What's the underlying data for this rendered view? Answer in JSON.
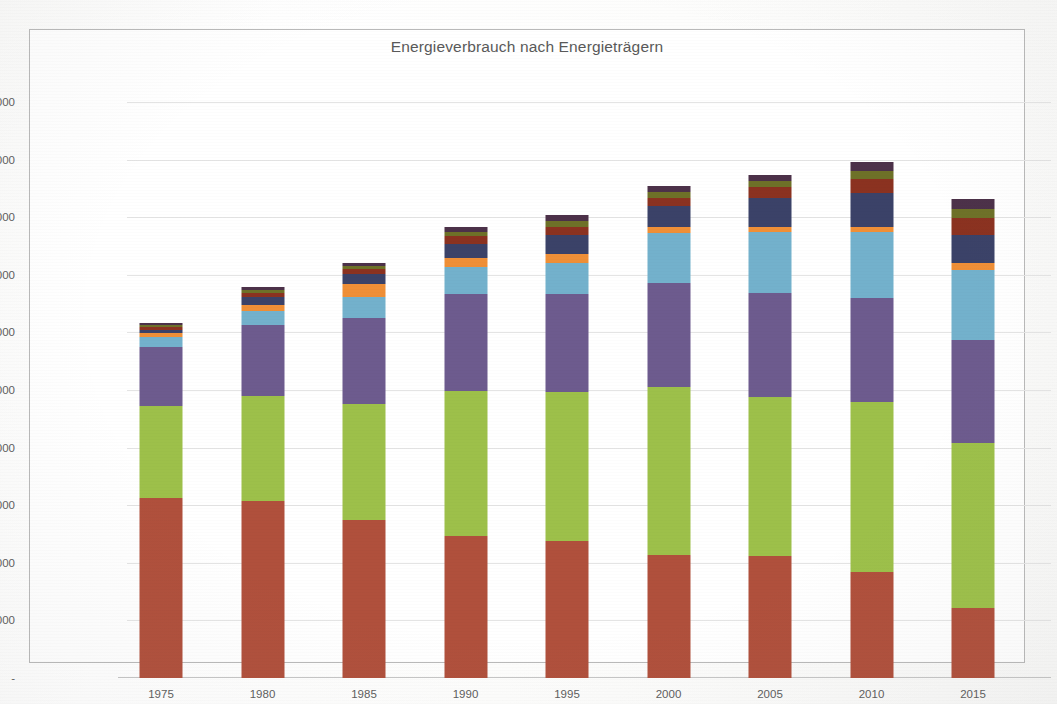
{
  "chart": {
    "title": "Energieverbrauch nach Energieträgern",
    "y_axis": {
      "tick_labels": [
        "1'000'000",
        "900'000",
        "800'000",
        "700'000",
        "600'000",
        "500'000",
        "400'000",
        "300'000",
        "200'000",
        "100'000",
        "-"
      ],
      "tick_values": [
        1000000,
        900000,
        800000,
        700000,
        600000,
        500000,
        400000,
        300000,
        200000,
        100000,
        0
      ]
    },
    "x_axis": {
      "tick_labels": [
        "1975",
        "1980",
        "1985",
        "1990",
        "1995",
        "2000",
        "2005",
        "2010",
        "2015"
      ]
    }
  },
  "chart_data": {
    "type": "bar",
    "subtype": "stacked",
    "title": "Energieverbrauch nach Energieträgern",
    "xlabel": "",
    "ylabel": "",
    "ylim": [
      0,
      1000000
    ],
    "grid": true,
    "legend": "none",
    "categories": [
      "1975",
      "1980",
      "1985",
      "1990",
      "1995",
      "2000",
      "2005",
      "2010",
      "2015"
    ],
    "series": [
      {
        "name": "Erdöl",
        "color": "#b0503c",
        "values": [
          313000,
          308000,
          274000,
          246000,
          238000,
          214000,
          211000,
          184000,
          122000
        ]
      },
      {
        "name": "Erdgas / Treibstoffe",
        "color": "#9ac councils"
      }
    ],
    "series_fixed": [
      {
        "name": "Erdöl",
        "color": "#b0503c",
        "values": [
          313000,
          308000,
          274000,
          246000,
          238000,
          214000,
          211000,
          184000,
          122000
        ]
      },
      {
        "name": "Treibstoffe",
        "color": "#9dc04a",
        "values": [
          159000,
          182000,
          202000,
          253000,
          258000,
          292000,
          277000,
          295000,
          286000
        ]
      },
      {
        "name": "Gas",
        "color": "#6d5b8e",
        "values": [
          103000,
          123000,
          149000,
          168000,
          171000,
          180000,
          180000,
          181000,
          178000
        ]
      },
      {
        "name": "Elektrizität",
        "color": "#73b1cc",
        "values": [
          17000,
          24000,
          37000,
          46000,
          54000,
          86000,
          106000,
          114000,
          123000
        ]
      },
      {
        "name": "Holz",
        "color": "#ef8f37",
        "values": [
          7000,
          11000,
          22000,
          17000,
          16000,
          11000,
          9000,
          9000,
          11000
        ]
      },
      {
        "name": "Fernwärme",
        "color": "#3b4268",
        "values": [
          6000,
          13000,
          17000,
          24000,
          32000,
          36000,
          50000,
          60000,
          50000
        ]
      },
      {
        "name": "Kohle",
        "color": "#8b3220",
        "values": [
          5000,
          8000,
          9000,
          13000,
          14000,
          14000,
          19000,
          24000,
          28000
        ]
      },
      {
        "name": "Abfälle",
        "color": "#6e7128",
        "values": [
          3000,
          5000,
          5000,
          8000,
          10000,
          10000,
          11000,
          14000,
          17000
        ]
      },
      {
        "name": "Übrige erneuerbare",
        "color": "#4c3149",
        "values": [
          3000,
          5000,
          5000,
          8000,
          11000,
          11000,
          11000,
          15000,
          17000
        ]
      }
    ],
    "totals": [
      616000,
      679000,
      720000,
      783000,
      804000,
      854000,
      874000,
      896000,
      832000
    ]
  }
}
